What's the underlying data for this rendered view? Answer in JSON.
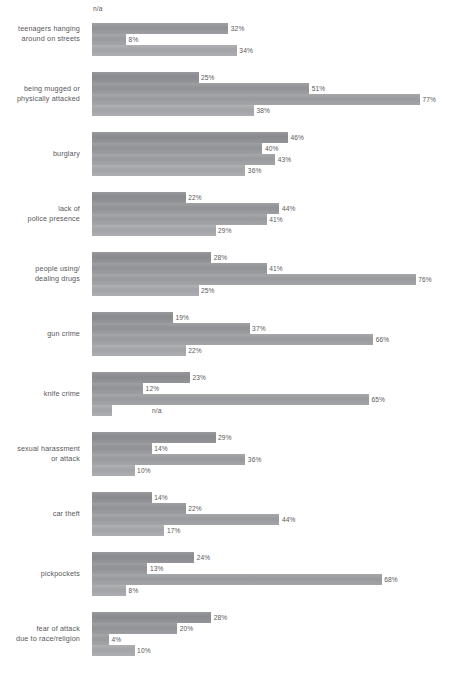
{
  "chart_data": {
    "type": "bar",
    "orientation": "horizontal",
    "title": "",
    "subtitle": "",
    "xlabel": "",
    "ylabel": "",
    "xlim": [
      0,
      80
    ],
    "grid": false,
    "legend": "none",
    "value_suffix": "%",
    "na_label": "n/a",
    "categories": [
      "teenagers hanging\naround on streets",
      "being mugged or\nphysically attacked",
      "burglary",
      "lack of\npolice presence",
      "people using/\ndealing drugs",
      "gun crime",
      "knife crime",
      "sexual harassment\nor attack",
      "car theft",
      "pickpockets",
      "fear of attack\ndue to race/religion"
    ],
    "series": [
      {
        "name": "series-1",
        "color": "#8f9093",
        "values": [
          null,
          25,
          46,
          22,
          28,
          19,
          23,
          29,
          14,
          24,
          28
        ],
        "labels": [
          "n/a",
          "25%",
          "46%",
          "22%",
          "28%",
          "19%",
          "23%",
          "29%",
          "14%",
          "24%",
          "28%"
        ]
      },
      {
        "name": "series-2",
        "color": "#97989b",
        "values": [
          32,
          51,
          40,
          44,
          41,
          37,
          12,
          14,
          22,
          13,
          20
        ],
        "labels": [
          "32%",
          "51%",
          "40%",
          "44%",
          "41%",
          "37%",
          "12%",
          "14%",
          "22%",
          "13%",
          "20%"
        ]
      },
      {
        "name": "series-3",
        "color": "#9fa0a3",
        "values": [
          8,
          77,
          43,
          41,
          76,
          66,
          65,
          36,
          44,
          68,
          4
        ],
        "labels": [
          "8%",
          "77%",
          "43%",
          "41%",
          "76%",
          "66%",
          "65%",
          "36%",
          "44%",
          "68%",
          "4%"
        ]
      },
      {
        "name": "series-4",
        "color": "#a9aaad",
        "values": [
          34,
          38,
          36,
          29,
          25,
          22,
          null,
          10,
          17,
          8,
          10
        ],
        "labels": [
          "34%",
          "38%",
          "36%",
          "29%",
          "25%",
          "22%",
          "n/a",
          "10%",
          "17%",
          "8%",
          "10%"
        ]
      }
    ],
    "groups": [
      {
        "label": "teenagers hanging\naround on streets",
        "bars": [
          {
            "label": "n/a",
            "value": null
          },
          {
            "label": "32%",
            "value": 32
          },
          {
            "label": "8%",
            "value": 8
          },
          {
            "label": "34%",
            "value": 34
          }
        ]
      },
      {
        "label": "being mugged or\nphysically attacked",
        "bars": [
          {
            "label": "25%",
            "value": 25
          },
          {
            "label": "51%",
            "value": 51
          },
          {
            "label": "77%",
            "value": 77
          },
          {
            "label": "38%",
            "value": 38
          }
        ]
      },
      {
        "label": "burglary",
        "bars": [
          {
            "label": "46%",
            "value": 46
          },
          {
            "label": "40%",
            "value": 40
          },
          {
            "label": "43%",
            "value": 43
          },
          {
            "label": "36%",
            "value": 36
          }
        ]
      },
      {
        "label": "lack of\npolice presence",
        "bars": [
          {
            "label": "22%",
            "value": 22
          },
          {
            "label": "44%",
            "value": 44
          },
          {
            "label": "41%",
            "value": 41
          },
          {
            "label": "29%",
            "value": 29
          }
        ]
      },
      {
        "label": "people using/\ndealing drugs",
        "bars": [
          {
            "label": "28%",
            "value": 28
          },
          {
            "label": "41%",
            "value": 41
          },
          {
            "label": "76%",
            "value": 76
          },
          {
            "label": "25%",
            "value": 25
          }
        ]
      },
      {
        "label": "gun crime",
        "bars": [
          {
            "label": "19%",
            "value": 19
          },
          {
            "label": "37%",
            "value": 37
          },
          {
            "label": "66%",
            "value": 66
          },
          {
            "label": "22%",
            "value": 22
          }
        ]
      },
      {
        "label": "knife crime",
        "bars": [
          {
            "label": "23%",
            "value": 23
          },
          {
            "label": "12%",
            "value": 12
          },
          {
            "label": "65%",
            "value": 65
          },
          {
            "label": "n/a",
            "value": null
          }
        ]
      },
      {
        "label": "sexual harassment\nor attack",
        "bars": [
          {
            "label": "29%",
            "value": 29
          },
          {
            "label": "14%",
            "value": 14
          },
          {
            "label": "36%",
            "value": 36
          },
          {
            "label": "10%",
            "value": 10
          }
        ]
      },
      {
        "label": "car theft",
        "bars": [
          {
            "label": "14%",
            "value": 14
          },
          {
            "label": "22%",
            "value": 22
          },
          {
            "label": "44%",
            "value": 44
          },
          {
            "label": "17%",
            "value": 17
          }
        ]
      },
      {
        "label": "pickpockets",
        "bars": [
          {
            "label": "24%",
            "value": 24
          },
          {
            "label": "13%",
            "value": 13
          },
          {
            "label": "68%",
            "value": 68
          },
          {
            "label": "8%",
            "value": 8
          }
        ]
      },
      {
        "label": "fear of attack\ndue to race/religion",
        "bars": [
          {
            "label": "28%",
            "value": 28
          },
          {
            "label": "20%",
            "value": 20
          },
          {
            "label": "4%",
            "value": 4
          },
          {
            "label": "10%",
            "value": 10
          }
        ]
      }
    ]
  },
  "layout": {
    "px_per_percent": 4.26,
    "na_bar_px": 20,
    "bar_height_px": 11,
    "group_pitch_px": 60,
    "first_group_top_px": 12
  }
}
